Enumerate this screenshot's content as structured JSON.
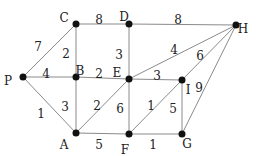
{
  "diagram": {
    "type": "weighted-graph",
    "nodes": [
      {
        "id": "C",
        "x": 76,
        "y": 24,
        "lx": 64,
        "ly": 18
      },
      {
        "id": "D",
        "x": 129,
        "y": 24,
        "lx": 124,
        "ly": 17
      },
      {
        "id": "H",
        "x": 236,
        "y": 25,
        "lx": 243,
        "ly": 29
      },
      {
        "id": "P",
        "x": 23,
        "y": 77,
        "lx": 8,
        "ly": 81
      },
      {
        "id": "B",
        "x": 76,
        "y": 77,
        "lx": 80,
        "ly": 71
      },
      {
        "id": "E",
        "x": 129,
        "y": 79,
        "lx": 117,
        "ly": 73
      },
      {
        "id": "I",
        "x": 182,
        "y": 80,
        "lx": 188,
        "ly": 90
      },
      {
        "id": "A",
        "x": 76,
        "y": 133,
        "lx": 64,
        "ly": 145
      },
      {
        "id": "F",
        "x": 129,
        "y": 134,
        "lx": 125,
        "ly": 150
      },
      {
        "id": "G",
        "x": 182,
        "y": 134,
        "lx": 187,
        "ly": 144
      }
    ],
    "edges": [
      {
        "from": "C",
        "to": "D",
        "weight": "8",
        "lx": 99,
        "ly": 20
      },
      {
        "from": "D",
        "to": "H",
        "weight": "8",
        "lx": 178,
        "ly": 20
      },
      {
        "from": "P",
        "to": "C",
        "weight": "7",
        "lx": 38,
        "ly": 47
      },
      {
        "from": "C",
        "to": "B",
        "weight": "2",
        "lx": 66,
        "ly": 54
      },
      {
        "from": "D",
        "to": "E",
        "weight": "3",
        "lx": 119,
        "ly": 55
      },
      {
        "from": "P",
        "to": "B",
        "weight": "4",
        "lx": 46,
        "ly": 74
      },
      {
        "from": "B",
        "to": "E",
        "weight": "2",
        "lx": 99,
        "ly": 74
      },
      {
        "from": "E",
        "to": "H",
        "weight": "4",
        "lx": 174,
        "ly": 50
      },
      {
        "from": "E",
        "to": "I",
        "weight": "3",
        "lx": 157,
        "ly": 76
      },
      {
        "from": "I",
        "to": "H",
        "weight": "6",
        "lx": 200,
        "ly": 56
      },
      {
        "from": "G",
        "to": "H",
        "weight": "9",
        "lx": 199,
        "ly": 88
      },
      {
        "from": "P",
        "to": "A",
        "weight": "1",
        "lx": 41,
        "ly": 114
      },
      {
        "from": "B",
        "to": "A",
        "weight": "3",
        "lx": 65,
        "ly": 107
      },
      {
        "from": "A",
        "to": "E",
        "weight": "2",
        "lx": 97,
        "ly": 106
      },
      {
        "from": "E",
        "to": "F",
        "weight": "6",
        "lx": 120,
        "ly": 109
      },
      {
        "from": "F",
        "to": "I",
        "weight": "1",
        "lx": 151,
        "ly": 106
      },
      {
        "from": "I",
        "to": "G",
        "weight": "5",
        "lx": 173,
        "ly": 109
      },
      {
        "from": "A",
        "to": "F",
        "weight": "5",
        "lx": 99,
        "ly": 145
      },
      {
        "from": "F",
        "to": "G",
        "weight": "1",
        "lx": 153,
        "ly": 145
      }
    ]
  }
}
